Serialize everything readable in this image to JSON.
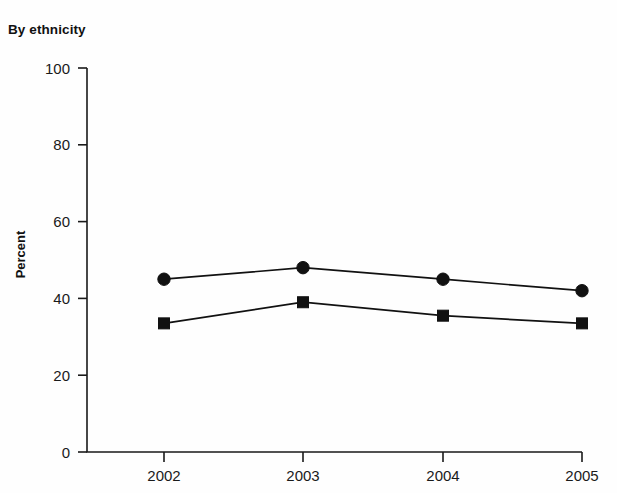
{
  "chart_data": {
    "type": "line",
    "title": "By ethnicity",
    "subtitle": "",
    "xlabel": "",
    "ylabel": "Percent",
    "categories": [
      "2002",
      "2003",
      "2004",
      "2005"
    ],
    "x": [
      2002,
      2003,
      2004,
      2005
    ],
    "xlim": [
      2002,
      2005
    ],
    "ylim": [
      0,
      100
    ],
    "ytick_labels": [
      "0",
      "20",
      "40",
      "60",
      "80",
      "100"
    ],
    "ytick_values": [
      0,
      20,
      40,
      60,
      80,
      100
    ],
    "xtick_labels": [
      "2002",
      "2003",
      "2004",
      "2005"
    ],
    "grid": false,
    "legend_position": "none",
    "annotations": [],
    "series": [
      {
        "name": "series-1",
        "marker": "circle",
        "color": "#111111",
        "values": [
          45,
          48,
          45,
          42
        ]
      },
      {
        "name": "series-2",
        "marker": "square",
        "color": "#111111",
        "values": [
          33.5,
          39,
          35.5,
          33.5
        ]
      }
    ]
  },
  "figure": {
    "background_color": "#ffffff",
    "axis_color": "#1a1a1a"
  }
}
